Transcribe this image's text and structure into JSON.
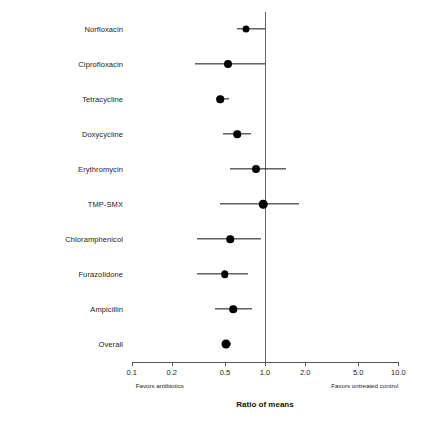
{
  "chart_data": {
    "type": "scatter",
    "title": "",
    "xlabel": "Ratio of means",
    "ylabel": "",
    "xscale": "log",
    "xlim": [
      0.1,
      10.0
    ],
    "grid": false,
    "legend": null,
    "reference_line": 1.0,
    "xticks": [
      0.1,
      0.2,
      0.5,
      1.0,
      2.0,
      5.0,
      10.0
    ],
    "xticklabels": [
      "0.1",
      "0.2",
      "0.5",
      "1.0",
      "2.0",
      "5.0",
      "10.0"
    ],
    "annotations": {
      "left": "Favors antibiotics",
      "right": "Favors untreated control"
    },
    "categories": [
      "Norfloxacin",
      "Ciprofloxacin",
      "Tetracycline",
      "Doxycycline",
      "Erythromycin",
      "TMP-SMX",
      "Chloramphenicol",
      "Furazolidone",
      "Ampicillin",
      "Overall"
    ],
    "points": [
      {
        "label": "Norfloxacin",
        "estimate": 0.72,
        "ci_low": 0.62,
        "ci_high": 1.0,
        "size": 7.0
      },
      {
        "label": "Ciprofloxacin",
        "estimate": 0.53,
        "ci_low": 0.3,
        "ci_high": 1.0,
        "size": 8.0
      },
      {
        "label": "Tetracycline",
        "estimate": 0.46,
        "ci_low": 0.43,
        "ci_high": 0.54,
        "size": 7.5
      },
      {
        "label": "Doxycycline",
        "estimate": 0.62,
        "ci_low": 0.48,
        "ci_high": 0.78,
        "size": 7.5
      },
      {
        "label": "Erythromycin",
        "estimate": 0.86,
        "ci_low": 0.55,
        "ci_high": 1.45,
        "size": 8.0
      },
      {
        "label": "TMP-SMX",
        "estimate": 0.97,
        "ci_low": 0.46,
        "ci_high": 1.8,
        "size": 8.5
      },
      {
        "label": "Chloramphenicol",
        "estimate": 0.55,
        "ci_low": 0.31,
        "ci_high": 0.94,
        "size": 7.5
      },
      {
        "label": "Furazolidone",
        "estimate": 0.5,
        "ci_low": 0.31,
        "ci_high": 0.75,
        "size": 7.5
      },
      {
        "label": "Ampicillin",
        "estimate": 0.58,
        "ci_low": 0.42,
        "ci_high": 0.8,
        "size": 7.5
      },
      {
        "label": "Overall",
        "estimate": 0.51,
        "ci_low": 0.48,
        "ci_high": 0.56,
        "size": 9.0
      }
    ]
  },
  "layout": {
    "plot_left_px": 131.7,
    "plot_right_px": 398.3,
    "axis_y_px": 362,
    "first_row_y_px": 29,
    "row_spacing_px": 35,
    "label_right_px": 123
  }
}
